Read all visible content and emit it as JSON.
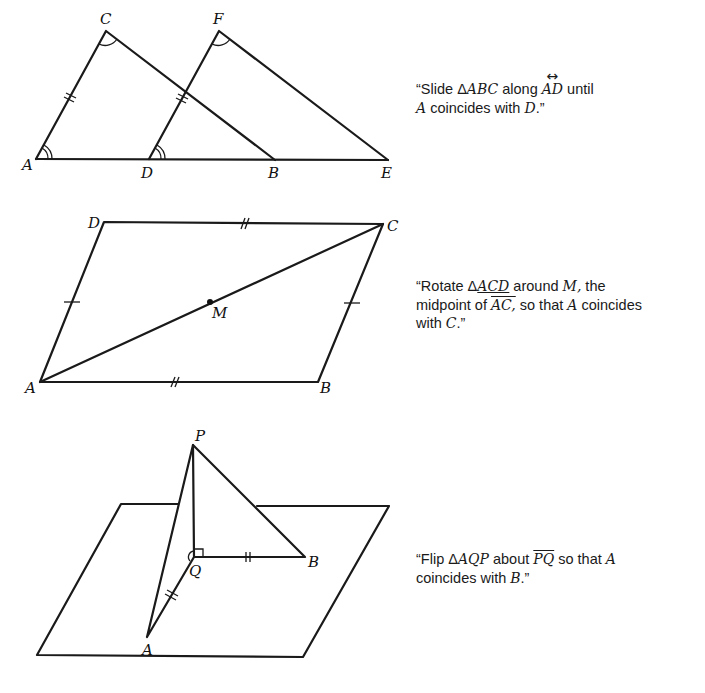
{
  "figures": [
    {
      "id": "slide",
      "transformation": "translation",
      "labels": {
        "A": "A",
        "B": "B",
        "C": "C",
        "D": "D",
        "E": "E",
        "F": "F"
      },
      "caption": {
        "open_quote": "“",
        "t1": "Slide ",
        "triangle_symbol": "Δ",
        "triangle": "ABC",
        "t2": " along ",
        "line": "AD",
        "t3": " until",
        "point1": "A",
        "t4": " coincides with ",
        "point2": "D",
        "close": ".”"
      }
    },
    {
      "id": "rotate",
      "transformation": "rotation",
      "labels": {
        "A": "A",
        "B": "B",
        "C": "C",
        "D": "D",
        "M": "M"
      },
      "caption": {
        "open_quote": "“",
        "t1": "Rotate ",
        "triangle_symbol": "Δ",
        "triangle": "ACD",
        "t2": " around ",
        "center": "M,",
        "t3": " the",
        "t4": "midpoint of ",
        "segment": "AC,",
        "t5": " so that ",
        "point1": "A",
        "t6": " coincides",
        "t7": "with ",
        "point2": "C",
        "close": ".”"
      }
    },
    {
      "id": "flip",
      "transformation": "reflection",
      "labels": {
        "P": "P",
        "Q": "Q",
        "A": "A",
        "B": "B"
      },
      "caption": {
        "open_quote": "“",
        "t1": "Flip ",
        "triangle_symbol": "Δ",
        "triangle": "AQP",
        "t2": " about ",
        "segment": "PQ",
        "t3": " so that ",
        "point1": "A",
        "t4": "coincides with ",
        "point2": "B",
        "close": ".”"
      }
    }
  ]
}
